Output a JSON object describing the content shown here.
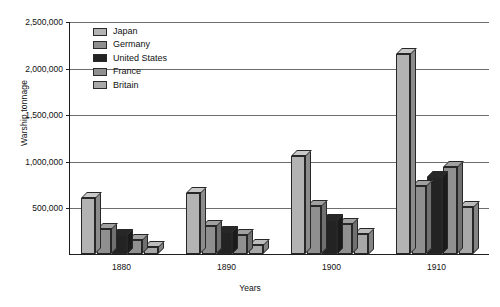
{
  "chart_data": {
    "type": "bar",
    "title": "",
    "subtitle": "",
    "xlabel": "Years",
    "ylabel": "Warship tonnage",
    "categories": [
      "1880",
      "1890",
      "1900",
      "1910"
    ],
    "ylim": [
      0,
      2500000
    ],
    "yticks": [
      0,
      500000,
      1000000,
      1500000,
      2000000,
      2500000
    ],
    "ytick_labels": [
      "",
      "500,000",
      "1,000,000",
      "1,500,000",
      "2,000,000",
      "2,500,000"
    ],
    "grid": true,
    "grid_axis": "y",
    "legend_position": "upper-left-inside",
    "style": "3d-bars",
    "series": [
      {
        "name": "Japan",
        "color": "#b3b3b3",
        "values": [
          600000,
          650000,
          1050000,
          2150000
        ]
      },
      {
        "name": "Germany",
        "color": "#8f8f8f",
        "values": [
          270000,
          300000,
          510000,
          730000
        ]
      },
      {
        "name": "United States",
        "color": "#232323",
        "values": [
          200000,
          240000,
          370000,
          830000
        ]
      },
      {
        "name": "France",
        "color": "#909090",
        "values": [
          150000,
          200000,
          320000,
          930000
        ]
      },
      {
        "name": "Britain",
        "color": "#a8a8a8",
        "values": [
          80000,
          100000,
          220000,
          500000
        ]
      }
    ]
  },
  "axes": {
    "y_label_text": "Warship tonnage",
    "x_label_text": "Years"
  },
  "colors": {
    "axis": "#1d1d1d",
    "grid": "#6d6d6d",
    "bar_outline": "#272727",
    "background": "#ffffff",
    "text": "#111111"
  }
}
